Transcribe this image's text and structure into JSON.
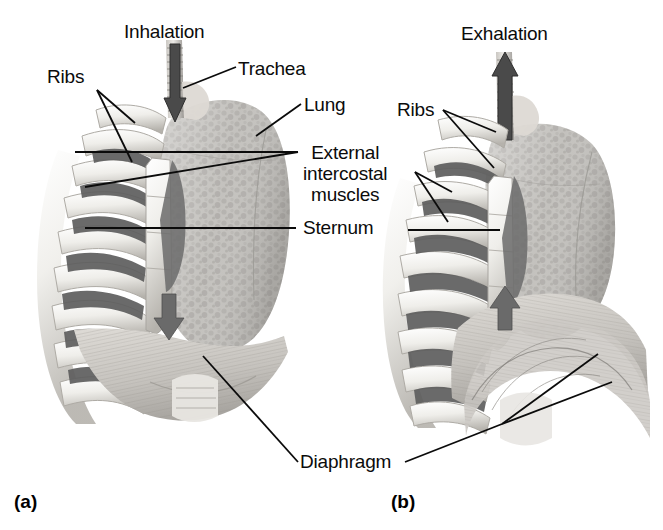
{
  "figure": {
    "type": "anatomical-illustration",
    "background_color": "#ffffff",
    "ink_color": "#0b0b0b"
  },
  "panels": [
    {
      "id": "a",
      "caption": "(a)",
      "phase_label": "Inhalation",
      "airflow_direction": "down",
      "diaphragm_state": "contracted-flattened"
    },
    {
      "id": "b",
      "caption": "(b)",
      "phase_label": "Exhalation",
      "airflow_direction": "up",
      "diaphragm_state": "relaxed-domed"
    }
  ],
  "labels": {
    "inhalation": "Inhalation",
    "exhalation": "Exhalation",
    "ribs_left": "Ribs",
    "ribs_right": "Ribs",
    "trachea": "Trachea",
    "lung": "Lung",
    "external_intercostal_muscles": "External\nintercostal\nmuscles",
    "sternum": "Sternum",
    "diaphragm": "Diaphragm"
  },
  "colors": {
    "bone": "#f2f1ee",
    "bone_shadow": "#b9b6b0",
    "intercostal_dark": "#6f6f6f",
    "lung_tissue": "#bfbdb9",
    "lung_tissue_dark": "#9c9a96",
    "diaphragm_muscle": "#c9c6c1",
    "arrow_dark": "#4a4a4a",
    "leader_line": "#0b0b0b"
  }
}
